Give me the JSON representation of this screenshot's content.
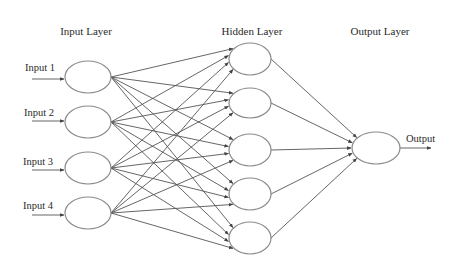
{
  "diagram": {
    "type": "feedforward-neural-network",
    "layers": [
      {
        "title": "Input Layer",
        "title_pos": [
          86,
          35
        ],
        "nodes": [
          {
            "id": "i1",
            "cx": 88,
            "cy": 77,
            "rx": 23,
            "ry": 16,
            "label": "Input 1",
            "label_pos": [
              25,
              71
            ],
            "arrow": [
              32,
              79,
              64,
              79
            ]
          },
          {
            "id": "i2",
            "cx": 88,
            "cy": 122,
            "rx": 23,
            "ry": 16,
            "label": "Input 2",
            "label_pos": [
              24,
              116
            ],
            "arrow": [
              32,
              121,
              64,
              121
            ]
          },
          {
            "id": "i3",
            "cx": 88,
            "cy": 168,
            "rx": 23,
            "ry": 16,
            "label": "Input 3",
            "label_pos": [
              23,
              165
            ],
            "arrow": [
              32,
              170,
              64,
              170
            ]
          },
          {
            "id": "i4",
            "cx": 88,
            "cy": 213,
            "rx": 23,
            "ry": 16,
            "label": "Input 4",
            "label_pos": [
              23,
              209
            ],
            "arrow": [
              32,
              215,
              64,
              215
            ]
          }
        ]
      },
      {
        "title": "Hidden Layer",
        "title_pos": [
          252,
          35
        ],
        "nodes": [
          {
            "id": "h1",
            "cx": 250,
            "cy": 59,
            "rx": 21,
            "ry": 16
          },
          {
            "id": "h2",
            "cx": 250,
            "cy": 103,
            "rx": 21,
            "ry": 15
          },
          {
            "id": "h3",
            "cx": 250,
            "cy": 150,
            "rx": 21,
            "ry": 16
          },
          {
            "id": "h4",
            "cx": 250,
            "cy": 194,
            "rx": 21,
            "ry": 16
          },
          {
            "id": "h5",
            "cx": 250,
            "cy": 238,
            "rx": 21,
            "ry": 16
          }
        ]
      },
      {
        "title": "Output Layer",
        "title_pos": [
          380,
          35
        ],
        "nodes": [
          {
            "id": "o1",
            "cx": 376,
            "cy": 148,
            "rx": 24,
            "ry": 16,
            "label": "Output",
            "label_pos": [
              406,
              142
            ],
            "arrow": [
              400,
              148,
              431,
              148
            ]
          }
        ]
      }
    ],
    "connections": "fully-connected (input→hidden, hidden→output), arrowheads at target",
    "colors": {
      "background": "#ffffff",
      "node_stroke": "#8a8a8a",
      "edge": "#555555",
      "text": "#2a2a2a"
    }
  }
}
